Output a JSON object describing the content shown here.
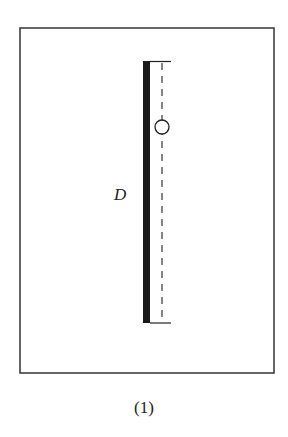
{
  "diagram": {
    "frame": {
      "x": 20,
      "y": 28,
      "width": 254,
      "height": 345
    },
    "thick_bar": {
      "x": 143,
      "y_top": 61,
      "y_bottom": 323,
      "width": 7
    },
    "dashed_line": {
      "x": 162,
      "y_top": 61,
      "y_bottom": 323
    },
    "top_tick": {
      "x1": 150,
      "x2": 171,
      "y": 61
    },
    "bottom_tick": {
      "x1": 150,
      "x2": 171,
      "y": 323
    },
    "circle": {
      "cx": 162,
      "cy": 127,
      "r": 7
    },
    "label": "D",
    "caption": "(1)",
    "colors": {
      "stroke": "#222222",
      "background": "#ffffff"
    }
  }
}
